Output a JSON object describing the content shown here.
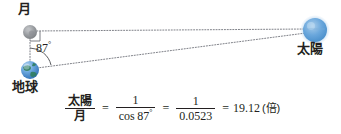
{
  "diagram": {
    "title_absent": "",
    "bodies": [
      {
        "id": "moon",
        "label": "月",
        "icon": "moon-icon",
        "cx": 30,
        "cy": 32,
        "r": 7,
        "color": "#8f9296"
      },
      {
        "id": "earth",
        "label": "地球",
        "icon": "earth-icon",
        "cx": 30,
        "cy": 70,
        "r": 9,
        "color": "#4a86c8"
      },
      {
        "id": "sun",
        "label": "太陽",
        "icon": "sun-icon",
        "cx": 315,
        "cy": 30,
        "r": 12,
        "color": "#5b9bd5"
      }
    ],
    "angle": {
      "value": "87",
      "degree_symbol": "°",
      "vertex": "earth"
    },
    "right_angle_marker": {
      "vertex": "moon",
      "size": 8
    },
    "lines": [
      {
        "from": "moon",
        "to": "sun",
        "style": "dotted"
      },
      {
        "from": "earth",
        "to": "sun",
        "style": "dotted"
      },
      {
        "from": "moon",
        "to": "earth",
        "style": "dotted"
      }
    ]
  },
  "formula": {
    "lhs": {
      "numerator": "太陽",
      "denominator": "月"
    },
    "equals_1": "=",
    "term_1": {
      "numerator": "1",
      "denominator_fn": "cos",
      "denominator_angle": "87",
      "denominator_degree": "°"
    },
    "equals_2": "=",
    "term_2": {
      "numerator": "1",
      "denominator": "0.0523"
    },
    "equals_3": "=",
    "result": "19.12",
    "result_unit": "(倍)"
  },
  "colors": {
    "ink": "#231f20",
    "moon_gray": "#8f9296",
    "earth_blue": "#4a86c8",
    "sun_blue": "#5b9bd5",
    "line_gray": "#6e7176"
  }
}
